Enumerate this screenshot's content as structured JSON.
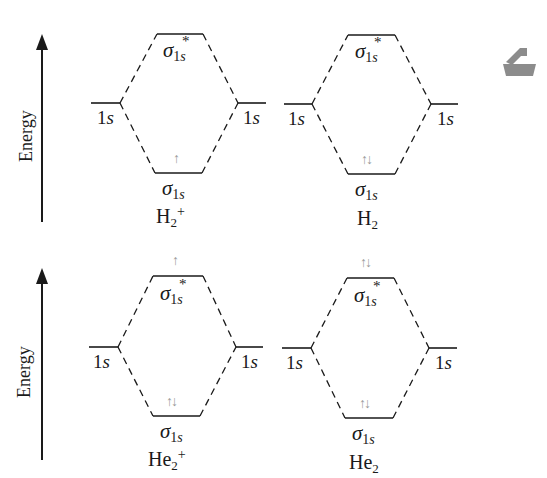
{
  "axis_label": "Energy",
  "atomic_orbital_label": {
    "main": "1",
    "italic": "s"
  },
  "bonding_label": {
    "symbol": "σ",
    "sub_main": "1",
    "sub_italic": "s"
  },
  "antibonding_label": {
    "symbol": "σ",
    "sub_main": "1",
    "sub_italic": "s",
    "star": "*"
  },
  "colors": {
    "lines": "#1a1a1a",
    "electrons": "#9a9a9a",
    "icon": "#8c8c8c"
  },
  "panels": [
    {
      "molecule": {
        "base": "H",
        "subscript": "2",
        "charge": "+"
      },
      "bonding_electrons": "↑",
      "antibonding_electrons": ""
    },
    {
      "molecule": {
        "base": "H",
        "subscript": "2",
        "charge": ""
      },
      "bonding_electrons": "↑↓",
      "antibonding_electrons": ""
    },
    {
      "molecule": {
        "base": "He",
        "subscript": "2",
        "charge": "+"
      },
      "bonding_electrons": "↑↓",
      "antibonding_electrons": "↑"
    },
    {
      "molecule": {
        "base": "He",
        "subscript": "2",
        "charge": ""
      },
      "bonding_electrons": "↑↓",
      "antibonding_electrons": "↑↓"
    }
  ],
  "side_icon": "bookmark-tray-icon"
}
